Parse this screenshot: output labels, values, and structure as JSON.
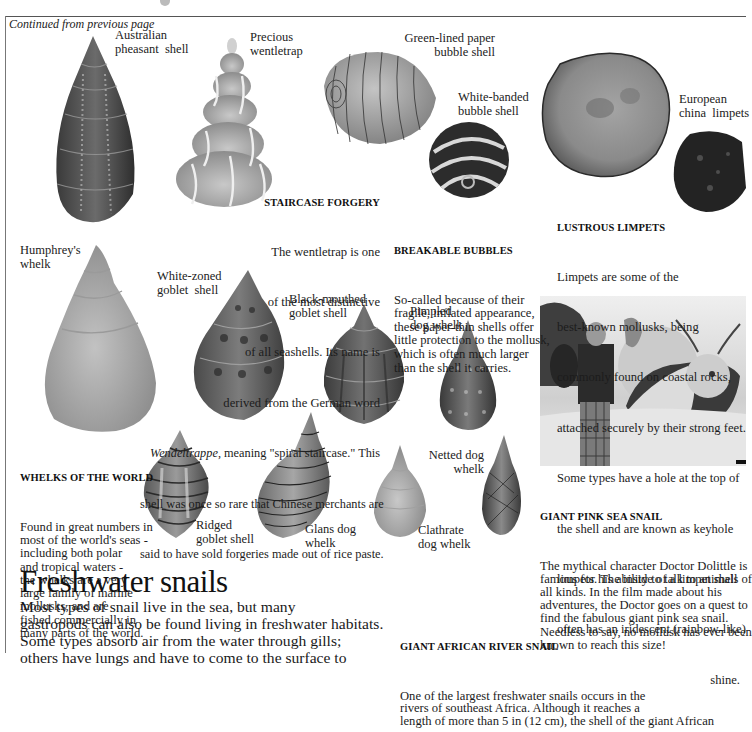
{
  "page": {
    "continued": "Continued from previous page"
  },
  "labels": {
    "australian_pheasant": "Australian\npheasant  shell",
    "precious_wentletrap": "Precious\nwentletrap",
    "green_lined": "Green-lined paper\nbubble shell",
    "white_banded": "White-banded\nbubble shell",
    "european_limpets": "European\nchina  limpets",
    "humphreys": "Humphrey's\nwhelk",
    "white_zoned": "White-zoned\ngoblet  shell",
    "black_mouthed": "Black-mouthed\ngoblet shell",
    "pimpled": "Pimpled\ndog whelk",
    "netted": "Netted dog\nwhelk",
    "ridged": "Ridged\ngoblet shell",
    "glans": "Glans dog\nwhelk",
    "clathrate": "Clathrate\ndog whelk"
  },
  "captions": {
    "staircase": {
      "heading": "STAIRCASE FORGERY",
      "lines": [
        "The wentletrap is one",
        "of the most distinctive",
        "of all seashells. Its name is",
        "derived from the German word",
        "Wendeltrappe, meaning \"spiral staircase.\" This",
        "shell was once so rare that Chinese merchants are",
        "said to have sold forgeries made out of rice paste."
      ]
    },
    "bubbles": {
      "heading": "BREAKABLE BUBBLES",
      "text": "So-called because of their\nfragile, inflated appearance,\nthese paper-thin shells offer\nlittle protection to the mollusk,\nwhich is often much larger\nthan the shell it carries."
    },
    "limpets": {
      "heading": "LUSTROUS LIMPETS",
      "lines": [
        "Limpets are some of the",
        "best-known mollusks, being",
        "commonly found on coastal rocks,",
        "attached securely by their strong feet.",
        "Some types have a hole at the top of",
        "the shell and are known as keyhole",
        "limpets. The inside of a limpet shell",
        "often has an iridescent (rainbow-like)"
      ],
      "last_line": "shine."
    },
    "whelks": {
      "heading": "WHELKS OF THE WORLD",
      "text": "Found in great numbers in\nmost of the world's seas -\nincluding both polar\nand tropical waters -\nthe whelks are a very\nlarge family of marine\nmollusks, and are\nfished commercially in\nmany parts of the world."
    },
    "pink_snail": {
      "heading": "GIANT PINK SEA SNAIL",
      "text": "The mythical character Doctor Dolittle is\nfamous for his ability to talk to animals of\nall kinds. In the film made about his\nadventures, the Doctor goes on a quest to\nfind the fabulous giant pink sea snail.\nNeedless to say, no mollusk has ever been\nknown to reach this size!"
    },
    "african_river": {
      "heading": "GIANT AFRICAN RIVER SNAIL",
      "text": "One of the largest freshwater snails occurs in the\nrivers of southeast Africa. Although it reaches a\nlength of more than 5 in (12 cm), the shell of the giant African"
    }
  },
  "section": {
    "title": "Freshwater snails",
    "intro": "Most types of snail live in the sea, but many\ngastropods can also be found living in freshwater habitats.\nSome types absorb air from the water through gills;\nothers have lungs and have to come to the surface to"
  },
  "images": {
    "shells": [
      "australian-pheasant-shell",
      "precious-wentletrap",
      "green-lined-paper-bubble-shell",
      "white-banded-bubble-shell",
      "european-china-limpet-large",
      "european-china-limpet-small",
      "humphreys-whelk",
      "white-zoned-goblet-shell",
      "black-mouthed-goblet-shell",
      "pimpled-dog-whelk",
      "ridged-goblet-shell",
      "glans-dog-whelk",
      "clathrate-dog-whelk",
      "netted-dog-whelk"
    ],
    "photo": "doctor-dolittle-giant-pink-sea-snail-photo"
  }
}
